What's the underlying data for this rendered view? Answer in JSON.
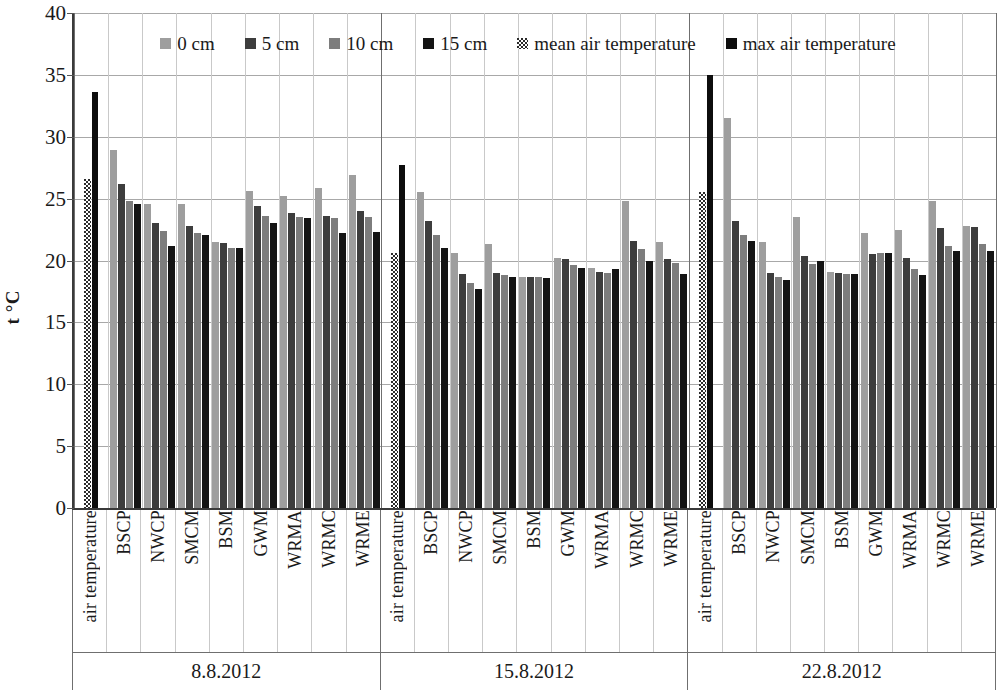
{
  "chart_data": {
    "type": "bar",
    "title": "",
    "xlabel": "",
    "ylabel": "t °C",
    "ylim": [
      0,
      40
    ],
    "ytick_step": 5,
    "yticks": [
      40,
      35,
      30,
      25,
      20,
      15,
      10,
      5,
      0
    ],
    "grid": true,
    "legend_position": "top-inside",
    "legend": [
      "0 cm",
      "5 cm",
      "10 cm",
      "15 cm",
      "mean air temperature",
      "max air temperature"
    ],
    "series_colors": {
      "0 cm": "#9e9e9e",
      "5 cm": "#3d3d3d",
      "10 cm": "#7d7d7d",
      "15 cm": "#141414",
      "mean air temperature": "#2b2b2b",
      "max air temperature": "#0d0d0d"
    },
    "group_label_field": "date",
    "categories": [
      "air temperature",
      "BSCP",
      "NWCP",
      "SMCM",
      "BSM",
      "GWM",
      "WRMA",
      "WRMC",
      "WRME"
    ],
    "soil_series": [
      "0 cm",
      "5 cm",
      "10 cm",
      "15 cm"
    ],
    "air_series": [
      "mean air temperature",
      "max air temperature"
    ],
    "groups": [
      {
        "date": "8.8.2012",
        "cells": [
          {
            "category": "air temperature",
            "kind": "air",
            "values": [
              26.6,
              33.6
            ]
          },
          {
            "category": "BSCP",
            "kind": "soil",
            "values": [
              28.9,
              26.2,
              24.8,
              24.6
            ]
          },
          {
            "category": "NWCP",
            "kind": "soil",
            "values": [
              24.6,
              23.0,
              22.4,
              21.2
            ]
          },
          {
            "category": "SMCM",
            "kind": "soil",
            "values": [
              24.6,
              22.8,
              22.2,
              22.1
            ]
          },
          {
            "category": "BSM",
            "kind": "soil",
            "values": [
              21.5,
              21.4,
              21.0,
              21.0
            ]
          },
          {
            "category": "GWM",
            "kind": "soil",
            "values": [
              25.6,
              24.4,
              23.6,
              23.0
            ]
          },
          {
            "category": "WRMA",
            "kind": "soil",
            "values": [
              25.2,
              23.8,
              23.5,
              23.4
            ]
          },
          {
            "category": "WRMC",
            "kind": "soil",
            "values": [
              25.9,
              23.6,
              23.4,
              22.2
            ]
          },
          {
            "category": "WRME",
            "kind": "soil",
            "values": [
              26.9,
              24.0,
              23.5,
              22.3
            ]
          }
        ]
      },
      {
        "date": "15.8.2012",
        "cells": [
          {
            "category": "air temperature",
            "kind": "air",
            "values": [
              20.6,
              27.7
            ]
          },
          {
            "category": "BSCP",
            "kind": "soil",
            "values": [
              25.5,
              23.2,
              22.1,
              21.0
            ]
          },
          {
            "category": "NWCP",
            "kind": "soil",
            "values": [
              20.6,
              18.9,
              18.2,
              17.7
            ]
          },
          {
            "category": "SMCM",
            "kind": "soil",
            "values": [
              21.3,
              19.0,
              18.8,
              18.7
            ]
          },
          {
            "category": "BSM",
            "kind": "soil",
            "values": [
              18.7,
              18.7,
              18.7,
              18.6
            ]
          },
          {
            "category": "GWM",
            "kind": "soil",
            "values": [
              20.2,
              20.1,
              19.6,
              19.4
            ]
          },
          {
            "category": "WRMA",
            "kind": "soil",
            "values": [
              19.4,
              19.1,
              19.0,
              19.3
            ]
          },
          {
            "category": "WRMC",
            "kind": "soil",
            "values": [
              24.8,
              21.6,
              20.9,
              20.0
            ]
          },
          {
            "category": "WRME",
            "kind": "soil",
            "values": [
              21.5,
              20.1,
              19.8,
              18.9
            ]
          }
        ]
      },
      {
        "date": "22.8.2012",
        "cells": [
          {
            "category": "air temperature",
            "kind": "air",
            "values": [
              25.5,
              35.0
            ]
          },
          {
            "category": "BSCP",
            "kind": "soil",
            "values": [
              31.5,
              23.2,
              22.1,
              21.6
            ]
          },
          {
            "category": "NWCP",
            "kind": "soil",
            "values": [
              21.5,
              19.0,
              18.7,
              18.4
            ]
          },
          {
            "category": "SMCM",
            "kind": "soil",
            "values": [
              23.5,
              20.4,
              19.7,
              20.0
            ]
          },
          {
            "category": "BSM",
            "kind": "soil",
            "values": [
              19.1,
              19.0,
              18.9,
              18.9
            ]
          },
          {
            "category": "GWM",
            "kind": "soil",
            "values": [
              22.2,
              20.5,
              20.6,
              20.6
            ]
          },
          {
            "category": "WRMA",
            "kind": "soil",
            "values": [
              22.5,
              20.2,
              19.3,
              18.8
            ]
          },
          {
            "category": "WRMC",
            "kind": "soil",
            "values": [
              24.8,
              22.6,
              21.2,
              20.8
            ]
          },
          {
            "category": "WRME",
            "kind": "soil",
            "values": [
              22.8,
              22.7,
              21.3,
              20.8
            ]
          }
        ]
      }
    ]
  }
}
